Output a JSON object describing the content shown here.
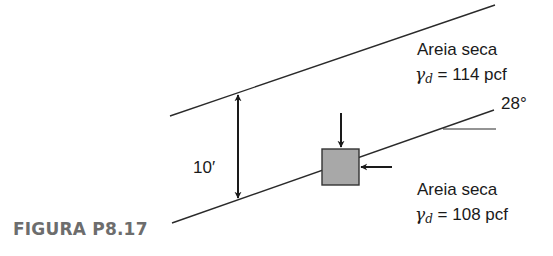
{
  "figure": {
    "caption": "FIGURA P8.17",
    "layers": [
      {
        "name": "Areia seca",
        "gamma_symbol": "γ",
        "gamma_subscript": "d",
        "equals": "=",
        "unit_weight": "114 pcf"
      },
      {
        "name": "Areia seca",
        "gamma_symbol": "γ",
        "gamma_subscript": "d",
        "equals": "=",
        "unit_weight": "108 pcf"
      }
    ],
    "thickness_label": "10′",
    "slope_angle_label": "28°",
    "colors": {
      "line": "#2a2a2a",
      "element_fill": "#a8a8a8",
      "caption": "#6d6d6d"
    }
  }
}
